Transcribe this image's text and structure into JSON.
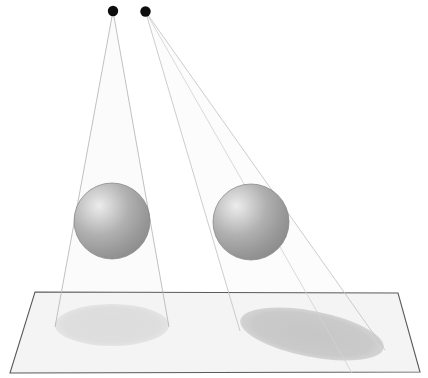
{
  "scene": {
    "title": "Two point light sources illuminating two spheres casting shadows on a ground plane",
    "background_color": "#ffffff",
    "width": 428,
    "height": 378
  },
  "lights": [
    {
      "name": "light-source-left",
      "label": "Light 1",
      "cx": 113,
      "cy": 11,
      "r": 5.2,
      "color": "#0d0d0d"
    },
    {
      "name": "light-source-right",
      "label": "Light 2",
      "cx": 145.5,
      "cy": 11.5,
      "r": 5.2,
      "color": "#0d0d0d"
    }
  ],
  "spheres": [
    {
      "name": "sphere-left",
      "label": "Sphere A",
      "cx": 112,
      "cy": 221,
      "r": 38,
      "highlight_color": "#e8e8e8",
      "mid_color": "#a8a8a8",
      "edge_color": "#8a8a8a",
      "stroke_color": "#7f7f7f"
    },
    {
      "name": "sphere-right",
      "label": "Sphere B",
      "cx": 251,
      "cy": 222,
      "r": 38,
      "highlight_color": "#e8e8e8",
      "mid_color": "#a8a8a8",
      "edge_color": "#8a8a8a",
      "stroke_color": "#7f7f7f"
    }
  ],
  "ground_plane": {
    "name": "ground-plane",
    "label": "Ground plane",
    "points": "35,292 398,293 420,372 10,373",
    "fill_color": "#f4f4f4",
    "stroke_color": "#5a5a5a",
    "stroke_width": 1.1
  },
  "shadows": [
    {
      "name": "shadow-left",
      "label": "Shadow A",
      "cx": 112,
      "cy": 325,
      "rx": 57,
      "ry": 21,
      "rotation": 0,
      "fill_color": "#dedede"
    },
    {
      "name": "shadow-right",
      "label": "Shadow B",
      "cx": 312,
      "cy": 334,
      "rx": 73,
      "ry": 23,
      "rotation": 11,
      "fill_color": "#c9c9c9"
    }
  ],
  "light_rays": [
    {
      "name": "ray-light1-left",
      "x1": 113,
      "y1": 11,
      "x2": 55,
      "y2": 327,
      "color": "#b6b6b6"
    },
    {
      "name": "ray-light1-right",
      "x1": 113,
      "y1": 11,
      "x2": 169,
      "y2": 327,
      "color": "#b6b6b6"
    },
    {
      "name": "ray-light2-left",
      "x1": 145.5,
      "y1": 11.5,
      "x2": 240,
      "y2": 331,
      "color": "#cccccc"
    },
    {
      "name": "ray-light2-right",
      "x1": 145.5,
      "y1": 11.5,
      "x2": 385,
      "y2": 350,
      "color": "#cccccc"
    },
    {
      "name": "ray-light2-inner",
      "x1": 145.5,
      "y1": 11.5,
      "x2": 352,
      "y2": 373,
      "color": "#d6d6d6"
    }
  ],
  "light_cones": [
    {
      "name": "light-cone-left",
      "points": "113,11 55,327 169,327",
      "fill_color": "#fbfbfb"
    },
    {
      "name": "light-cone-right",
      "points": "145.5,11.5 240,331 385,350",
      "fill_color": "#fcfcfc"
    }
  ]
}
